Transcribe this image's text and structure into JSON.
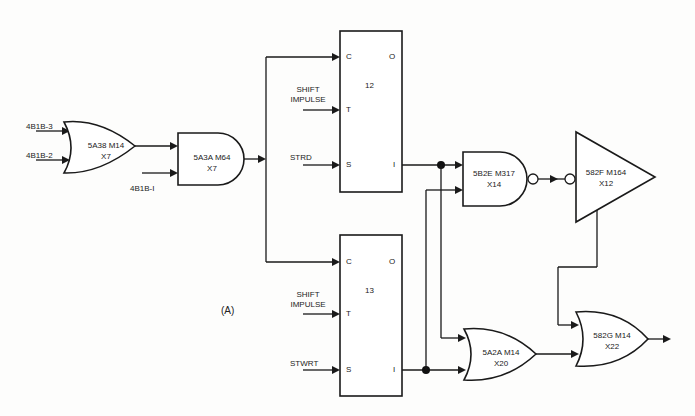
{
  "figure_label": "(A)",
  "inputs": {
    "in1": "4B1B-3",
    "in2": "4B1B-2",
    "in3": "4B1B-I",
    "shift_12": [
      "SHIFT",
      "IMPULSE"
    ],
    "strd": "STRD",
    "shift_13": [
      "SHIFT",
      "IMPULSE"
    ],
    "stwrt": "STWRT"
  },
  "gates": {
    "or1": {
      "type": "OR",
      "name": "5A38 M14",
      "loc": "X7"
    },
    "and1": {
      "type": "AND",
      "name": "5A3A M64",
      "loc": "X7"
    },
    "nand1": {
      "type": "NAND",
      "name": "5B2E M317",
      "loc": "X14"
    },
    "buf1": {
      "type": "BUFFER",
      "name": "582F M164",
      "loc": "X12"
    },
    "or2": {
      "type": "OR",
      "name": "5A2A M14",
      "loc": "X20"
    },
    "or3": {
      "type": "OR",
      "name": "582G M14",
      "loc": "X22"
    }
  },
  "flipflops": [
    {
      "id": "12",
      "pins": {
        "c": "C",
        "o": "O",
        "t": "T",
        "s": "S",
        "i": "I"
      }
    },
    {
      "id": "13",
      "pins": {
        "c": "C",
        "o": "O",
        "t": "T",
        "s": "S",
        "i": "I"
      }
    }
  ],
  "colors": {
    "line": "#1a1a1a",
    "background": "#fdfdfc"
  }
}
